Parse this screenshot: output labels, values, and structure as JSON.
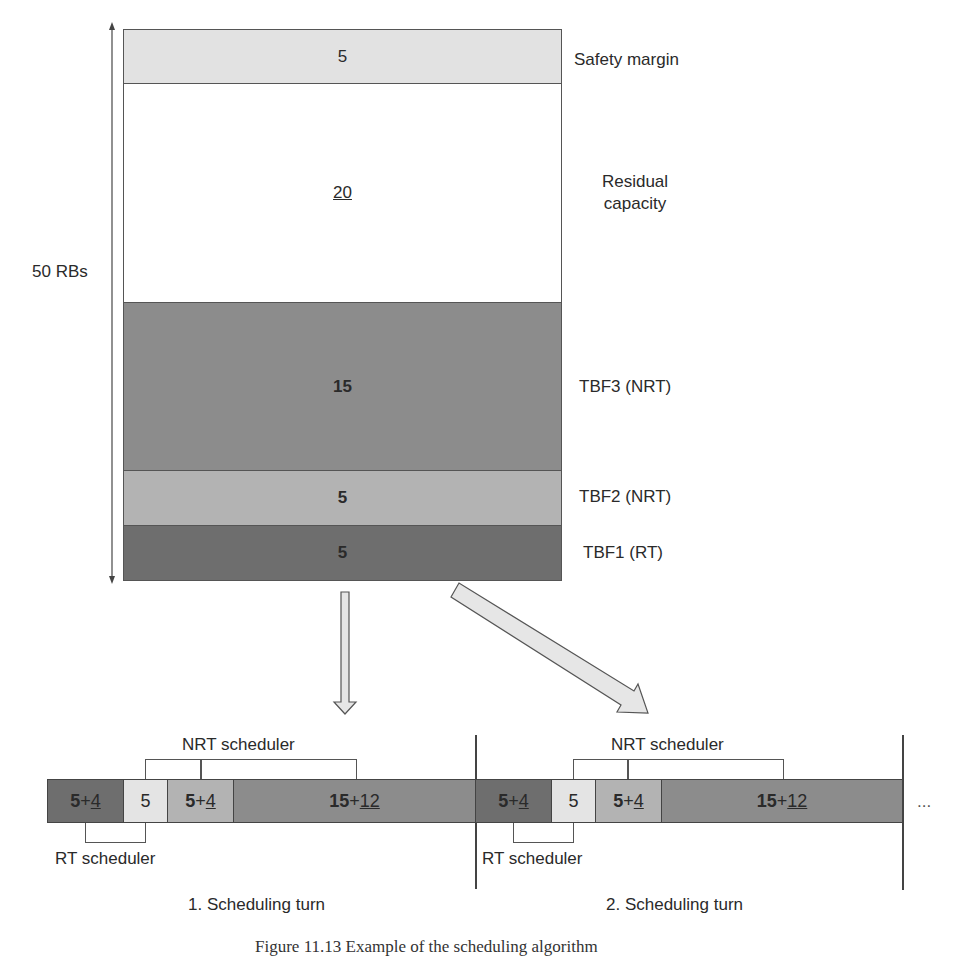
{
  "colors": {
    "safety_margin": "#e2e2e2",
    "residual": "#ffffff",
    "tbf3_nrt": "#8c8c8c",
    "tbf2_nrt": "#b3b3b3",
    "tbf1_rt": "#6e6e6e",
    "light_seg": "#e4e4e4",
    "border": "#555555"
  },
  "stack": {
    "total_label": "50 RBs",
    "blocks": [
      {
        "value": "5",
        "label": "Safety margin",
        "style": "normal"
      },
      {
        "value": "20",
        "label": "Residual capacity",
        "label_line1": "Residual",
        "label_line2": "capacity",
        "style": "underline"
      },
      {
        "value": "15",
        "label": "TBF3 (NRT)",
        "style": "bold"
      },
      {
        "value": "5",
        "label": "TBF2 (NRT)",
        "style": "bold"
      },
      {
        "value": "5",
        "label": "TBF1 (RT)",
        "style": "bold"
      }
    ]
  },
  "turns": [
    {
      "caption": "1. Scheduling turn",
      "nrt_scheduler_label": "NRT scheduler",
      "rt_scheduler_label": "RT scheduler",
      "segments": [
        {
          "base": "5",
          "plus": "+",
          "extra": "4"
        },
        {
          "base": "5"
        },
        {
          "base": "5",
          "plus": "+",
          "extra": "4"
        },
        {
          "base": "15",
          "plus": "+",
          "extra": "12"
        }
      ]
    },
    {
      "caption": "2. Scheduling turn",
      "nrt_scheduler_label": "NRT scheduler",
      "rt_scheduler_label": "RT scheduler",
      "segments": [
        {
          "base": "5",
          "plus": "+",
          "extra": "4"
        },
        {
          "base": "5"
        },
        {
          "base": "5",
          "plus": "+",
          "extra": "4"
        },
        {
          "base": "15",
          "plus": "+",
          "extra": "12"
        }
      ]
    }
  ],
  "continuation": "...",
  "figure_caption": "Figure 11.13   Example of the scheduling algorithm"
}
